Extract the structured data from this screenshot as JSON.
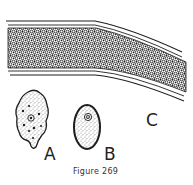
{
  "figure": {
    "caption": "Figure 269",
    "labels": {
      "a": "A",
      "b": "B",
      "c": "C"
    },
    "parts": [
      {
        "id": "A",
        "description": "amoeboid cell with granular cytoplasm, dark inclusions and central nucleus"
      },
      {
        "id": "B",
        "description": "oval cell with stippled cytoplasm and concentric nucleus"
      },
      {
        "id": "C",
        "description": "curved tube/band densely packed with small cells"
      }
    ],
    "colors": {
      "ink": "#1e1e1e",
      "background": "#ffffff"
    }
  }
}
